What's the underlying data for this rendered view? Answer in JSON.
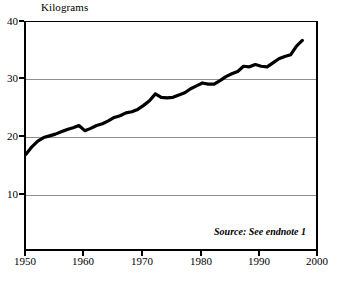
{
  "chart_data": {
    "type": "line",
    "title": "",
    "ylabel": "Kilograms",
    "xlabel": "",
    "ylim": [
      0,
      40
    ],
    "xlim": [
      1950,
      2000
    ],
    "yticks": [
      10,
      20,
      30,
      40
    ],
    "xticks": [
      1950,
      1960,
      1970,
      1980,
      1990,
      2000
    ],
    "grid": "horizontal",
    "legend": "none",
    "line_color": "#000000",
    "gridline_color": "#8e8e8e",
    "annotation": "Source: See endnote 1",
    "series": [
      {
        "name": "Kilograms per person",
        "x": [
          1950,
          1951,
          1952,
          1953,
          1954,
          1955,
          1956,
          1957,
          1958,
          1959,
          1960,
          1961,
          1962,
          1963,
          1964,
          1965,
          1966,
          1967,
          1968,
          1969,
          1970,
          1971,
          1972,
          1973,
          1974,
          1975,
          1976,
          1977,
          1978,
          1979,
          1980,
          1981,
          1982,
          1983,
          1984,
          1985,
          1986,
          1987,
          1988,
          1989,
          1990,
          1991,
          1992,
          1993,
          1994,
          1995,
          1996,
          1997
        ],
        "values": [
          17.0,
          18.3,
          19.3,
          19.9,
          20.2,
          20.5,
          20.9,
          21.3,
          21.6,
          22.0,
          21.1,
          21.5,
          22.0,
          22.3,
          22.8,
          23.4,
          23.7,
          24.2,
          24.4,
          24.8,
          25.5,
          26.3,
          27.5,
          26.9,
          26.8,
          26.9,
          27.3,
          27.7,
          28.4,
          28.9,
          29.4,
          29.2,
          29.2,
          29.8,
          30.5,
          31.0,
          31.4,
          32.3,
          32.2,
          32.6,
          32.3,
          32.2,
          32.9,
          33.6,
          34.0,
          34.3,
          35.8,
          36.8
        ]
      }
    ]
  },
  "axes": {
    "y_labels": [
      "40",
      "30",
      "20",
      "10"
    ],
    "x_labels": [
      "1950",
      "1960",
      "1970",
      "1980",
      "1990",
      "2000"
    ]
  },
  "labels": {
    "y_axis_title": "Kilograms",
    "source": "Source: See endnote 1"
  }
}
